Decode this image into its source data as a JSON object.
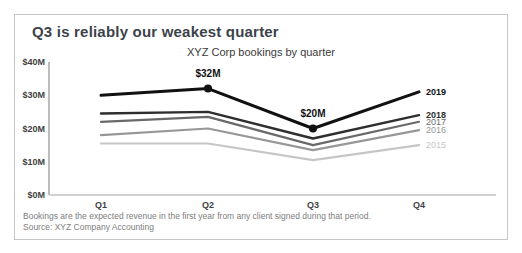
{
  "headline": "Q3 is reliably our weakest quarter",
  "footnote": {
    "line1": "Bookings are the expected revenue in the first year from any client signed during that period.",
    "line2": "Source: XYZ Company Accounting"
  },
  "colors": {
    "headline": "#3c434b",
    "axis_line": "#a6a6a6",
    "baseline": "#d2d2d2",
    "tick_label": "#3f3f3f",
    "annotation": "#111111"
  },
  "chart_data": {
    "type": "line",
    "title": "XYZ Corp bookings by quarter",
    "categories": [
      "Q1",
      "Q2",
      "Q3",
      "Q4"
    ],
    "xlabel": "",
    "ylabel": "",
    "unit": "$M",
    "ylim": [
      0,
      40
    ],
    "grid": false,
    "legend_position": "right-of-line-ends",
    "yticks": [
      {
        "label": "$40M",
        "value": 40
      },
      {
        "label": "$30M",
        "value": 30
      },
      {
        "label": "$20M",
        "value": 20
      },
      {
        "label": "$10M",
        "value": 10
      },
      {
        "label": "$0M",
        "value": 0
      }
    ],
    "series": [
      {
        "name": "2019",
        "values": [
          30,
          32,
          20,
          31
        ],
        "color": "#111111",
        "width": 3,
        "bold_label": true,
        "annotations": [
          {
            "index": 1,
            "label": "$32M"
          },
          {
            "index": 2,
            "label": "$20M"
          }
        ]
      },
      {
        "name": "2018",
        "values": [
          24.5,
          25,
          17,
          24
        ],
        "color": "#2e2e2e",
        "width": 2.4,
        "bold_label": true,
        "annotations": []
      },
      {
        "name": "2017",
        "values": [
          22,
          23.5,
          15,
          22
        ],
        "color": "#696969",
        "width": 2.2,
        "bold_label": false,
        "annotations": []
      },
      {
        "name": "2016",
        "values": [
          18,
          20,
          13.5,
          19.5
        ],
        "color": "#979797",
        "width": 2.2,
        "bold_label": false,
        "annotations": []
      },
      {
        "name": "2015",
        "values": [
          15.5,
          15.5,
          10.5,
          15
        ],
        "color": "#c6c6c6",
        "width": 2.2,
        "bold_label": false,
        "annotations": []
      }
    ]
  }
}
